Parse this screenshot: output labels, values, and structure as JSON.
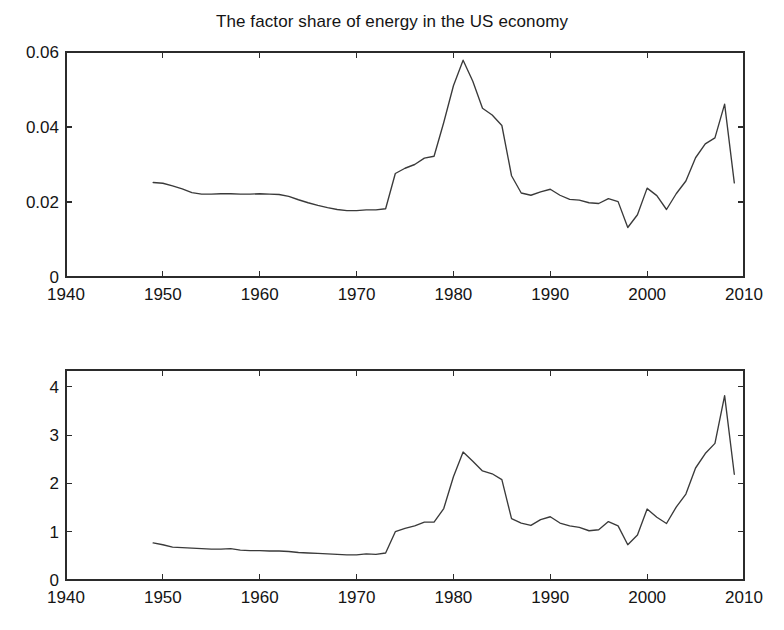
{
  "figure": {
    "background": "#ffffff",
    "line_color": "#3a3a3a",
    "axis_color": "#2b2b2b"
  },
  "chart_data": [
    {
      "type": "line",
      "title": "The factor share of energy in the US economy",
      "xlabel": "",
      "ylabel": "",
      "xlim": [
        1940,
        2010
      ],
      "ylim": [
        0,
        0.06
      ],
      "xticks": [
        1940,
        1950,
        1960,
        1970,
        1980,
        1990,
        2000,
        2010
      ],
      "xticklabels": [
        "1940",
        "1950",
        "1960",
        "1970",
        "1980",
        "1990",
        "2000",
        "2010"
      ],
      "yticks": [
        0,
        0.02,
        0.04,
        0.06
      ],
      "yticklabels": [
        "0",
        "0.02",
        "0.04",
        "0.06"
      ],
      "grid": false,
      "legend": false,
      "x": [
        1949,
        1950,
        1951,
        1952,
        1953,
        1954,
        1955,
        1956,
        1957,
        1958,
        1959,
        1960,
        1961,
        1962,
        1963,
        1964,
        1965,
        1966,
        1967,
        1968,
        1969,
        1970,
        1971,
        1972,
        1973,
        1974,
        1975,
        1976,
        1977,
        1978,
        1979,
        1980,
        1981,
        1982,
        1983,
        1984,
        1985,
        1986,
        1987,
        1988,
        1989,
        1990,
        1991,
        1992,
        1993,
        1994,
        1995,
        1996,
        1997,
        1998,
        1999,
        2000,
        2001,
        2002,
        2003,
        2004,
        2005,
        2006,
        2007,
        2008,
        2009
      ],
      "y": [
        0.0252,
        0.025,
        0.0243,
        0.0235,
        0.0225,
        0.0221,
        0.0221,
        0.0222,
        0.0222,
        0.0221,
        0.0221,
        0.0222,
        0.0221,
        0.022,
        0.0215,
        0.0206,
        0.0198,
        0.0191,
        0.0185,
        0.018,
        0.0177,
        0.0177,
        0.0179,
        0.0179,
        0.0182,
        0.0276,
        0.029,
        0.03,
        0.0317,
        0.0322,
        0.0412,
        0.051,
        0.0578,
        0.0522,
        0.045,
        0.0432,
        0.0404,
        0.027,
        0.0224,
        0.0218,
        0.0227,
        0.0234,
        0.0218,
        0.0207,
        0.0205,
        0.0198,
        0.0196,
        0.0209,
        0.0201,
        0.0132,
        0.0166,
        0.0237,
        0.0217,
        0.018,
        0.0222,
        0.0256,
        0.0318,
        0.0355,
        0.0371,
        0.0461,
        0.0251
      ]
    },
    {
      "type": "line",
      "title": "Fossil fuel price (composite)",
      "xlabel": "",
      "ylabel": "",
      "xlim": [
        1940,
        2010
      ],
      "ylim": [
        0,
        4.35
      ],
      "xticks": [
        1940,
        1950,
        1960,
        1970,
        1980,
        1990,
        2000,
        2010
      ],
      "xticklabels": [
        "1940",
        "1950",
        "1960",
        "1970",
        "1980",
        "1990",
        "2000",
        "2010"
      ],
      "yticks": [
        0,
        1,
        2,
        3,
        4
      ],
      "yticklabels": [
        "0",
        "1",
        "2",
        "3",
        "4"
      ],
      "grid": false,
      "legend": false,
      "x": [
        1949,
        1950,
        1951,
        1952,
        1953,
        1954,
        1955,
        1956,
        1957,
        1958,
        1959,
        1960,
        1961,
        1962,
        1963,
        1964,
        1965,
        1966,
        1967,
        1968,
        1969,
        1970,
        1971,
        1972,
        1973,
        1974,
        1975,
        1976,
        1977,
        1978,
        1979,
        1980,
        1981,
        1982,
        1983,
        1984,
        1985,
        1986,
        1987,
        1988,
        1989,
        1990,
        1991,
        1992,
        1993,
        1994,
        1995,
        1996,
        1997,
        1998,
        1999,
        2000,
        2001,
        2002,
        2003,
        2004,
        2005,
        2006,
        2007,
        2008,
        2009
      ],
      "y": [
        0.77,
        0.73,
        0.68,
        0.67,
        0.66,
        0.65,
        0.64,
        0.64,
        0.65,
        0.62,
        0.61,
        0.61,
        0.6,
        0.6,
        0.59,
        0.57,
        0.56,
        0.55,
        0.54,
        0.53,
        0.52,
        0.52,
        0.54,
        0.53,
        0.56,
        1.0,
        1.07,
        1.12,
        1.2,
        1.2,
        1.48,
        2.14,
        2.65,
        2.46,
        2.26,
        2.2,
        2.08,
        1.27,
        1.18,
        1.13,
        1.25,
        1.31,
        1.18,
        1.12,
        1.09,
        1.02,
        1.04,
        1.21,
        1.12,
        0.73,
        0.93,
        1.47,
        1.3,
        1.17,
        1.51,
        1.78,
        2.32,
        2.62,
        2.83,
        3.82,
        2.19
      ]
    }
  ]
}
